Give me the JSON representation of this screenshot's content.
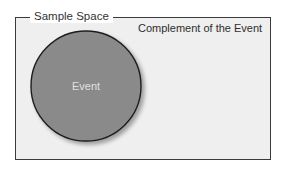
{
  "diagram": {
    "sample_space_label": "Sample Space",
    "complement_label": "Complement of the Event",
    "event_label": "Event",
    "colors": {
      "event_fill": "#8a8a8a",
      "space_fill": "#efefef",
      "border": "#3a3a3a"
    }
  }
}
